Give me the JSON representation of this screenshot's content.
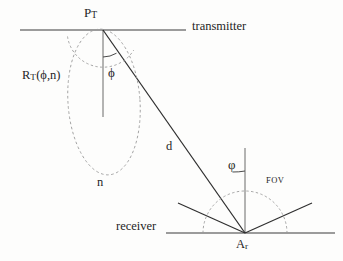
{
  "figure": {
    "background_color": "#fdfdfc",
    "line_color": "#3a3a3a",
    "dashed_color": "#8a8a8a",
    "text_color": "#1f1f1f"
  },
  "labels": {
    "transmitter_point": "P",
    "transmitter_point_sub": "T",
    "transmitter_plane": "transmitter",
    "radiation_pattern": "R",
    "radiation_pattern_sub": "T",
    "radiation_pattern_args": "(ϕ,n)",
    "emission_angle": "ϕ",
    "mode_number": "n",
    "distance": "d",
    "incidence_angle": "φ",
    "field_of_view": "FOV",
    "receiver_plane": "receiver",
    "receiver_area": "A",
    "receiver_area_sub": "r"
  },
  "geometry": {
    "transmitter_line": {
      "x1": 20,
      "y1": 30,
      "x2": 186,
      "y2": 30
    },
    "receiver_line": {
      "x1": 166,
      "y1": 233,
      "x2": 335,
      "y2": 233
    },
    "transmitter_point": {
      "x": 103,
      "y": 30
    },
    "receiver_point": {
      "x": 245,
      "y": 233
    },
    "transmitter_normal": {
      "x1": 103,
      "y1": 30,
      "x2": 103,
      "y2": 117
    },
    "receiver_normal": {
      "x1": 245,
      "y1": 148,
      "x2": 245,
      "y2": 233
    },
    "path_d": {
      "x1": 103,
      "y1": 30,
      "x2": 245,
      "y2": 233
    },
    "fov_ray_left": {
      "x1": 245,
      "y1": 233,
      "x2": 178,
      "y2": 203
    },
    "fov_ray_right": {
      "x1": 245,
      "y1": 233,
      "x2": 312,
      "y2": 203
    },
    "lobe_ellipse": {
      "cx": 104,
      "cy": 102,
      "rx": 36,
      "ry": 73,
      "rotate": -4
    },
    "emission_arc": {
      "cx": 103,
      "cy": 30,
      "r": 36
    },
    "incidence_arc": {
      "cx": 245,
      "cy": 233,
      "r": 42
    },
    "emission_tick_arc": {
      "cx": 103,
      "cy": 30,
      "r": 27
    },
    "incidence_tick_arc": {
      "cx": 245,
      "cy": 233,
      "r": 62
    }
  }
}
